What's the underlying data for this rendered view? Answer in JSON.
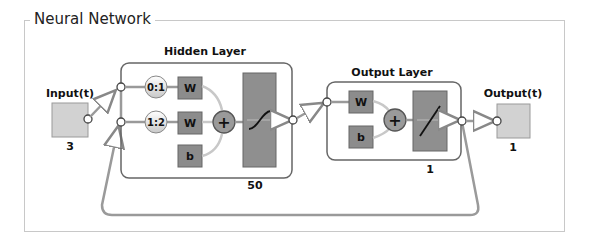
{
  "panel": {
    "title": "Neural Network"
  },
  "input": {
    "label": "Input(t)",
    "size": "3"
  },
  "hidden_layer": {
    "title": "Hidden Layer",
    "size": "50",
    "delays": [
      "0:1",
      "1:2"
    ],
    "weights": [
      "W",
      "W"
    ],
    "bias": "b",
    "sum_symbol": "+",
    "transfer": "tansig"
  },
  "output_layer": {
    "title": "Output Layer",
    "size": "1",
    "weight": "W",
    "bias": "b",
    "sum_symbol": "+",
    "transfer": "purelin"
  },
  "output": {
    "label": "Output(t)",
    "size": "1"
  },
  "colors": {
    "node_fill": "#d2d2d2",
    "weight_fill": "#8c8c8c",
    "transfer_fill": "#8f8f8f",
    "sum_fill": "#9a9a9a",
    "line": "#9a9a9a",
    "border": "#555555"
  }
}
